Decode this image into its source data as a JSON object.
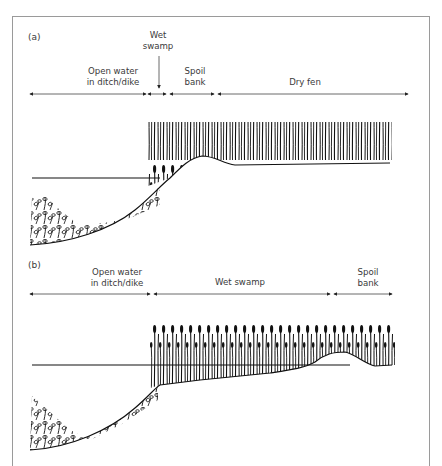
{
  "figure": {
    "panels": [
      {
        "id": "a",
        "label": "(a)",
        "zones": [
          {
            "line1": "Open water",
            "line2": "in ditch/dike"
          },
          {
            "line1": "Wet",
            "line2": "swamp"
          },
          {
            "line1": "Spoil",
            "line2": "bank"
          },
          {
            "line1": "Dry fen",
            "line2": ""
          }
        ]
      },
      {
        "id": "b",
        "label": "(b)",
        "zones": [
          {
            "line1": "Open water",
            "line2": "in ditch/dike"
          },
          {
            "line1": "Wet swamp",
            "line2": ""
          },
          {
            "line1": "Spoil",
            "line2": "bank"
          }
        ]
      }
    ],
    "colors": {
      "ink": "#111111",
      "frame": "#9a9a9a",
      "text": "#3a3a3a"
    }
  }
}
